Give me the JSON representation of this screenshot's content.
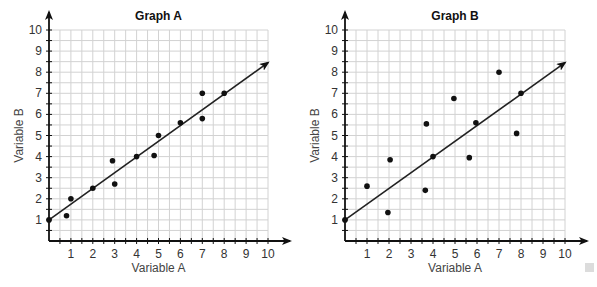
{
  "chart_data": [
    {
      "type": "scatter",
      "title": "Graph A",
      "xlabel": "Variable A",
      "ylabel": "Variable B",
      "xlim": [
        0,
        10
      ],
      "ylim": [
        0,
        10
      ],
      "x_ticks": [
        1,
        2,
        3,
        4,
        5,
        6,
        7,
        8,
        9,
        10
      ],
      "y_ticks": [
        1,
        2,
        3,
        4,
        5,
        6,
        7,
        8,
        9,
        10
      ],
      "grid": true,
      "minor_grid_step": 0.5,
      "points": [
        {
          "x": 0,
          "y": 1
        },
        {
          "x": 0.8,
          "y": 1.2
        },
        {
          "x": 1,
          "y": 2
        },
        {
          "x": 2,
          "y": 2.5
        },
        {
          "x": 2.9,
          "y": 3.8
        },
        {
          "x": 3,
          "y": 2.7
        },
        {
          "x": 4,
          "y": 4
        },
        {
          "x": 4.8,
          "y": 4.05
        },
        {
          "x": 5,
          "y": 5
        },
        {
          "x": 6,
          "y": 5.6
        },
        {
          "x": 7,
          "y": 7
        },
        {
          "x": 7,
          "y": 5.8
        },
        {
          "x": 8,
          "y": 7
        }
      ],
      "trend_line": {
        "from": {
          "x": 0,
          "y": 1
        },
        "to": {
          "x": 10,
          "y": 8.45
        },
        "arrow": true
      }
    },
    {
      "type": "scatter",
      "title": "Graph B",
      "xlabel": "Variable A",
      "ylabel": "Variable B",
      "xlim": [
        0,
        10
      ],
      "ylim": [
        0,
        10
      ],
      "x_ticks": [
        1,
        2,
        3,
        4,
        5,
        6,
        7,
        8,
        9,
        10
      ],
      "y_ticks": [
        1,
        2,
        3,
        4,
        5,
        6,
        7,
        8,
        9,
        10
      ],
      "grid": true,
      "minor_grid_step": 0.5,
      "points": [
        {
          "x": 0,
          "y": 1
        },
        {
          "x": 1,
          "y": 2.6
        },
        {
          "x": 1.95,
          "y": 1.35
        },
        {
          "x": 2.05,
          "y": 3.85
        },
        {
          "x": 3.65,
          "y": 2.4
        },
        {
          "x": 3.7,
          "y": 5.55
        },
        {
          "x": 4,
          "y": 4
        },
        {
          "x": 4.95,
          "y": 6.75
        },
        {
          "x": 5.65,
          "y": 3.95
        },
        {
          "x": 5.95,
          "y": 5.6
        },
        {
          "x": 7,
          "y": 8
        },
        {
          "x": 7.8,
          "y": 5.1
        },
        {
          "x": 8,
          "y": 7
        }
      ],
      "trend_line": {
        "from": {
          "x": 0,
          "y": 1
        },
        "to": {
          "x": 10,
          "y": 8.45
        },
        "arrow": true
      }
    }
  ],
  "layout": {
    "graphs": [
      {
        "x0": 49,
        "y0": 241,
        "px_per_x": 21.9,
        "px_per_y": 21.1
      },
      {
        "x0": 345,
        "y0": 241,
        "px_per_x": 22.0,
        "px_per_y": 21.1
      }
    ]
  }
}
